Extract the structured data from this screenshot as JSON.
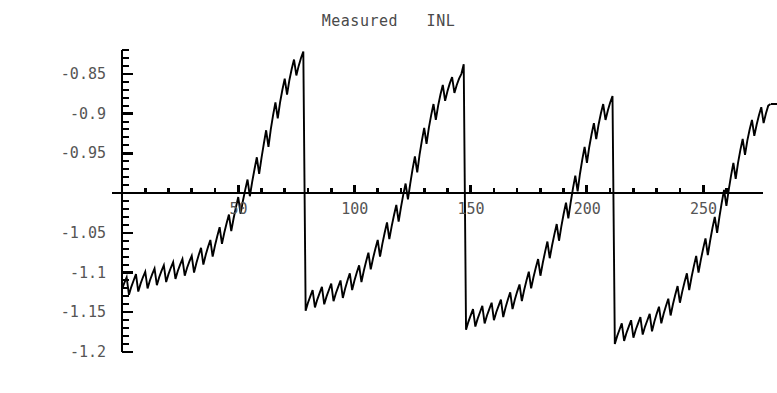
{
  "chart_data": {
    "type": "line",
    "title": "Measured   INL",
    "xlabel": "",
    "ylabel": "",
    "xlim": [
      0,
      268
    ],
    "ylim": [
      -1.2,
      -0.82
    ],
    "grid": false,
    "legend": null,
    "axis_line_y": -1.0,
    "x_ticks_labeled": [
      50,
      100,
      150,
      200,
      250
    ],
    "x_tick_labels": [
      "50",
      "100",
      "150",
      "200",
      "250"
    ],
    "x_minor_tick_step": 10,
    "y_ticks_labeled": [
      -0.85,
      -0.9,
      -0.95,
      -1.05,
      -1.1,
      -1.15,
      -1.2
    ],
    "y_tick_labels": [
      "-0.85",
      "-0.9",
      "-0.95",
      "-1.05",
      "-1.1",
      "-1.15",
      "-1.2"
    ],
    "y_minor_tick_step": 0.01,
    "y_major_tick_step": 0.05,
    "series_name": "INL",
    "line_color": "#000000",
    "series": [
      {
        "name": "INL",
        "description": "Segmented sawtooth: major period 64 codes, minor zigzag period 4 codes",
        "major_period": 64,
        "minor_period": 4,
        "segment_rise": 0.27,
        "minor_amplitude": 0.022,
        "segment_start_value": -1.125,
        "n_points": 263,
        "segment_breaks": [
          64,
          128,
          192
        ],
        "values": [
          -1.121,
          -1.113,
          -1.106,
          -1.128,
          -1.118,
          -1.11,
          -1.102,
          -1.124,
          -1.114,
          -1.106,
          -1.099,
          -1.12,
          -1.11,
          -1.102,
          -1.095,
          -1.116,
          -1.106,
          -1.098,
          -1.091,
          -1.112,
          -1.102,
          -1.094,
          -1.087,
          -1.108,
          -1.098,
          -1.09,
          -1.083,
          -1.104,
          -1.094,
          -1.086,
          -1.079,
          -1.1,
          -1.088,
          -1.078,
          -1.069,
          -1.09,
          -1.078,
          -1.068,
          -1.059,
          -1.08,
          -1.066,
          -1.054,
          -1.043,
          -1.064,
          -1.05,
          -1.038,
          -1.027,
          -1.048,
          -1.032,
          -1.018,
          -1.005,
          -1.026,
          -1.01,
          -0.996,
          -0.983,
          -1.004,
          -0.986,
          -0.97,
          -0.955,
          -0.976,
          -0.956,
          -0.938,
          -0.921,
          -0.942,
          -0.92,
          -0.902,
          -0.886,
          -0.906,
          -0.886,
          -0.87,
          -0.856,
          -0.876,
          -0.858,
          -0.844,
          -0.832,
          -0.852,
          -0.84,
          -0.83,
          -0.822,
          -1.148,
          -1.138,
          -1.13,
          -1.122,
          -1.144,
          -1.134,
          -1.126,
          -1.118,
          -1.14,
          -1.13,
          -1.122,
          -1.114,
          -1.136,
          -1.126,
          -1.118,
          -1.11,
          -1.132,
          -1.12,
          -1.11,
          -1.101,
          -1.122,
          -1.11,
          -1.1,
          -1.091,
          -1.112,
          -1.098,
          -1.086,
          -1.075,
          -1.096,
          -1.082,
          -1.07,
          -1.059,
          -1.08,
          -1.064,
          -1.05,
          -1.037,
          -1.058,
          -1.042,
          -1.028,
          -1.015,
          -1.036,
          -1.018,
          -1.002,
          -0.988,
          -1.008,
          -0.988,
          -0.97,
          -0.954,
          -0.974,
          -0.952,
          -0.934,
          -0.918,
          -0.938,
          -0.918,
          -0.902,
          -0.888,
          -0.908,
          -0.89,
          -0.876,
          -0.864,
          -0.884,
          -0.872,
          -0.862,
          -0.854,
          -0.874,
          -0.864,
          -0.856,
          -0.85,
          -0.838,
          -1.172,
          -1.162,
          -1.154,
          -1.146,
          -1.168,
          -1.158,
          -1.15,
          -1.142,
          -1.164,
          -1.154,
          -1.146,
          -1.138,
          -1.16,
          -1.15,
          -1.142,
          -1.134,
          -1.156,
          -1.144,
          -1.134,
          -1.125,
          -1.146,
          -1.134,
          -1.124,
          -1.115,
          -1.136,
          -1.122,
          -1.11,
          -1.099,
          -1.12,
          -1.106,
          -1.094,
          -1.083,
          -1.104,
          -1.088,
          -1.074,
          -1.061,
          -1.082,
          -1.066,
          -1.052,
          -1.039,
          -1.06,
          -1.042,
          -1.026,
          -1.012,
          -1.032,
          -1.012,
          -0.994,
          -0.978,
          -0.998,
          -0.976,
          -0.958,
          -0.942,
          -0.962,
          -0.942,
          -0.926,
          -0.912,
          -0.932,
          -0.914,
          -0.9,
          -0.888,
          -0.908,
          -0.896,
          -0.886,
          -0.878,
          -1.19,
          -1.18,
          -1.172,
          -1.164,
          -1.186,
          -1.176,
          -1.168,
          -1.16,
          -1.182,
          -1.172,
          -1.164,
          -1.156,
          -1.178,
          -1.168,
          -1.16,
          -1.152,
          -1.174,
          -1.162,
          -1.152,
          -1.143,
          -1.164,
          -1.152,
          -1.142,
          -1.133,
          -1.154,
          -1.14,
          -1.128,
          -1.117,
          -1.138,
          -1.124,
          -1.112,
          -1.101,
          -1.122,
          -1.106,
          -1.092,
          -1.079,
          -1.1,
          -1.084,
          -1.07,
          -1.057,
          -1.078,
          -1.06,
          -1.044,
          -1.03,
          -1.05,
          -1.03,
          -1.012,
          -0.996,
          -1.016,
          -0.996,
          -0.978,
          -0.962,
          -0.982,
          -0.962,
          -0.946,
          -0.932,
          -0.952,
          -0.934,
          -0.92,
          -0.908,
          -0.928,
          -0.914,
          -0.902,
          -0.892,
          -0.912,
          -0.9,
          -0.89,
          -0.888
        ]
      }
    ]
  }
}
